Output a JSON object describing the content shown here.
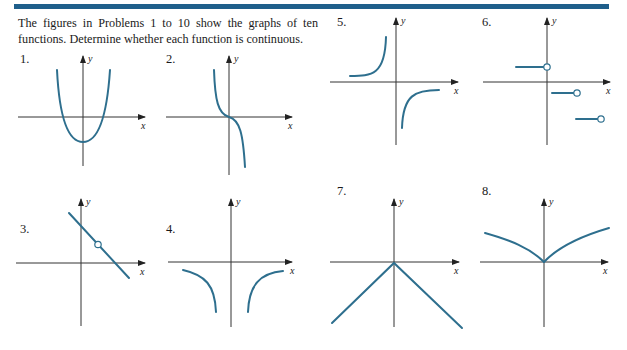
{
  "header": {
    "accent_bar_color": "#1f5f8b"
  },
  "intro": {
    "text": "The figures in Problems 1 to 10 show the graphs of ten functions. Determine whether each function is continuous."
  },
  "problems": [
    {
      "number": "1.",
      "description": "upward parabola, vertex below origin"
    },
    {
      "number": "2.",
      "description": "decreasing cubic-like curve through origin"
    },
    {
      "number": "3.",
      "description": "decreasing line with open circle (removable hole)"
    },
    {
      "number": "4.",
      "description": "two branches below x-axis, vertical asymptote at y-axis"
    },
    {
      "number": "5.",
      "description": "hyperbola-like branches with vertical asymptote near y-axis"
    },
    {
      "number": "6.",
      "description": "step function with open circles at right endpoints"
    },
    {
      "number": "7.",
      "description": "inverted V (negative absolute value)"
    },
    {
      "number": "8.",
      "description": "cusp at origin, concave-down branches rising outward"
    }
  ],
  "axis_labels": {
    "x": "x",
    "y": "y"
  },
  "colors": {
    "curve": "#2e6f8e",
    "axis": "#333333"
  }
}
